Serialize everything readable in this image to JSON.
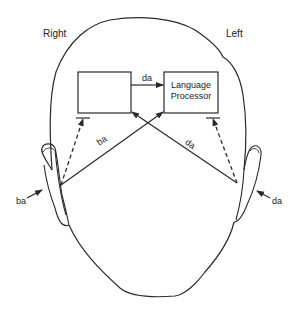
{
  "diagram": {
    "type": "dichotic listening / language lateralization head diagram",
    "side_labels": {
      "right": "Right",
      "left": "Left"
    },
    "boxes": [
      {
        "id": "right-hemisphere-box",
        "label": ""
      },
      {
        "id": "language-processor-box",
        "label_line1": "Language",
        "label_line2": "Processor"
      }
    ],
    "arrows": {
      "callosal": {
        "label": "da",
        "from": "right-hemisphere-box",
        "to": "language-processor-box",
        "style": "solid"
      },
      "right_ear_contralateral": {
        "label": "ba",
        "from": "right-ear",
        "to": "language-processor-box",
        "style": "solid"
      },
      "left_ear_contralateral": {
        "label": "da",
        "from": "left-ear",
        "to": "right-hemisphere-box",
        "style": "solid"
      },
      "right_ear_ipsilateral": {
        "label": "",
        "from": "right-ear",
        "to": "right-hemisphere-box",
        "style": "dashed-inhibited"
      },
      "left_ear_ipsilateral": {
        "label": "",
        "from": "left-ear",
        "to": "language-processor-box",
        "style": "dashed-inhibited"
      }
    },
    "ear_inputs": {
      "right_ear": "ba",
      "left_ear": "da"
    },
    "colors": {
      "line": "#2a2a2a",
      "background": "#ffffff"
    }
  }
}
